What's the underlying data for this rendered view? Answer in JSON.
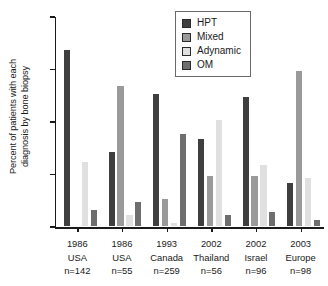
{
  "chart_data": {
    "type": "bar",
    "title": "",
    "subtitle": "",
    "xlabel": "",
    "ylabel": "Percent of patients with each\ndiagnosis by bone biopsy",
    "ylim": [
      0,
      80
    ],
    "yticks": [
      0,
      20,
      40,
      60,
      80
    ],
    "grid": false,
    "legend_position": "upper-right",
    "categories": [
      "1986 USA n=142",
      "1986 USA n=55",
      "1993 Canada n=259",
      "2002 Thailand n=56",
      "2002 Israel n=96",
      "2003 Europe n=98"
    ],
    "category_lines": [
      [
        "1986",
        "USA",
        "n=142"
      ],
      [
        "1986",
        "USA",
        "n=55"
      ],
      [
        "1993",
        "Canada",
        "n=259"
      ],
      [
        "2002",
        "Thailand",
        "n=56"
      ],
      [
        "2002",
        "Israel",
        "n=96"
      ],
      [
        "2003",
        "Europe",
        "n=98"
      ]
    ],
    "series": [
      {
        "name": "HPT",
        "color": "#3f3f3f",
        "values": [
          68,
          29,
          51,
          34,
          50,
          17
        ]
      },
      {
        "name": "Mixed",
        "color": "#9a9a9a",
        "values": [
          0,
          54,
          11,
          20,
          20,
          60
        ]
      },
      {
        "name": "Adynamic",
        "color": "#e0e0e0",
        "values": [
          25,
          5,
          2,
          41,
          24,
          19
        ]
      },
      {
        "name": "OM",
        "color": "#6e6e6e",
        "values": [
          7,
          10,
          36,
          5,
          6,
          3
        ]
      }
    ]
  },
  "legend": {
    "items": [
      {
        "label": "HPT"
      },
      {
        "label": "Mixed"
      },
      {
        "label": "Adynamic"
      },
      {
        "label": "OM"
      }
    ]
  }
}
